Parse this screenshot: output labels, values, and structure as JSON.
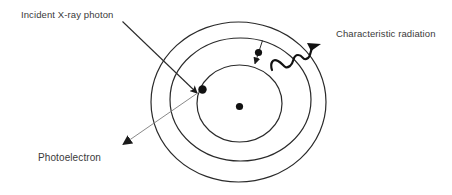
{
  "diagram": {
    "type": "atomic-shell-diagram",
    "labels": {
      "incident": "Incident X-ray photon",
      "characteristic": "Characteristic radiation",
      "photoelectron": "Photoelectron"
    },
    "nucleus": {
      "cx": 239.5,
      "cy": 106.5,
      "r": 3.5
    },
    "shells": [
      {
        "name": "inner-shell",
        "cx": 239.5,
        "cy": 103.5,
        "rx": 42.5,
        "ry": 38.5
      },
      {
        "name": "middle-shell",
        "cx": 240.5,
        "cy": 99.5,
        "rx": 70.5,
        "ry": 61.5
      },
      {
        "name": "outer-shell",
        "cx": 238.5,
        "cy": 102,
        "rx": 87.5,
        "ry": 80
      }
    ],
    "ejected_electron": {
      "cx": 202.5,
      "cy": 89.5,
      "r": 4
    },
    "falling_electron": {
      "cx": 258.5,
      "cy": 52.5,
      "r": 3.5
    },
    "arrows": {
      "incident": {
        "x1": 122.5,
        "y1": 21.5,
        "x2": 197,
        "y2": 93
      },
      "photoelectron": {
        "x1": 202,
        "y1": 90,
        "x2": 122,
        "y2": 145
      },
      "electron_transition": {
        "x1": 262.5,
        "y1": 40.5,
        "x2": 255,
        "y2": 63.5
      }
    },
    "colors": {
      "line": "#2a2a2a",
      "photoelectron_line": "#8a8a8a",
      "text": "#3a3a3a",
      "background": "#ffffff"
    }
  }
}
